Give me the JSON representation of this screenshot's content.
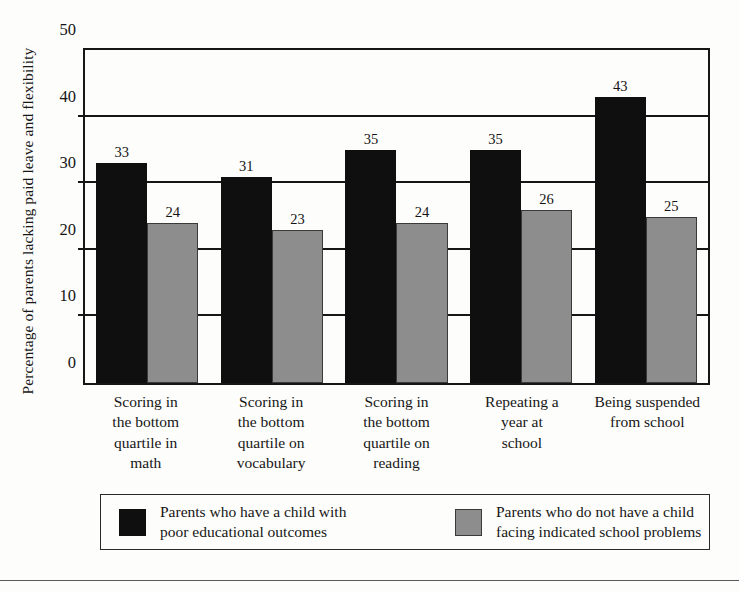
{
  "chart_data": {
    "type": "bar",
    "title": "",
    "xlabel": "",
    "ylabel": "Percentage of parents lacking paid leave and flexibility",
    "ylim": [
      0,
      50
    ],
    "yticks": [
      0,
      10,
      20,
      30,
      40,
      50
    ],
    "grid": true,
    "legend_position": "bottom",
    "categories": [
      "Scoring in\nthe bottom\nquartile in\nmath",
      "Scoring in\nthe bottom\nquartile on\nvocabulary",
      "Scoring in\nthe bottom\nquartile on\nreading",
      "Repeating a\nyear at\nschool",
      "Being suspended\nfrom school"
    ],
    "series": [
      {
        "name": "Parents who have a child with\npoor educational outcomes",
        "color": "#100f0f",
        "values": [
          33,
          31,
          35,
          35,
          43
        ]
      },
      {
        "name": "Parents who do not have a child\nfacing indicated school problems",
        "color": "#8d8d8d",
        "values": [
          24,
          23,
          24,
          26,
          25
        ]
      }
    ]
  },
  "legend": {
    "entries": [
      {
        "label": "Parents who have a child with\npoor educational outcomes",
        "swatch": "dark"
      },
      {
        "label": "Parents who do not have a child\nfacing indicated school problems",
        "swatch": "light"
      }
    ]
  }
}
